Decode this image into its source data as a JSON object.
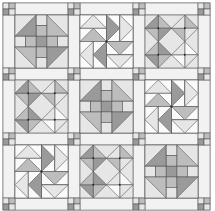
{
  "quilt": {
    "rows": 3,
    "cols": 3,
    "colors": {
      "background": "#ffffff",
      "sashing": "#f2f2f2",
      "outline": "#555555",
      "light": "#e6e6e6",
      "medium": "#bdbdbd",
      "dark": "#9a9a9a",
      "white": "#fafafa"
    },
    "blocks": [
      {
        "row": 0,
        "col": 0,
        "type": "churn-dash"
      },
      {
        "row": 0,
        "col": 1,
        "type": "pinwheel"
      },
      {
        "row": 0,
        "col": 2,
        "type": "diamond-star"
      },
      {
        "row": 1,
        "col": 0,
        "type": "diamond-star"
      },
      {
        "row": 1,
        "col": 1,
        "type": "churn-dash"
      },
      {
        "row": 1,
        "col": 2,
        "type": "pinwheel"
      },
      {
        "row": 2,
        "col": 0,
        "type": "pinwheel"
      },
      {
        "row": 2,
        "col": 1,
        "type": "diamond-star"
      },
      {
        "row": 2,
        "col": 2,
        "type": "churn-dash"
      }
    ]
  }
}
